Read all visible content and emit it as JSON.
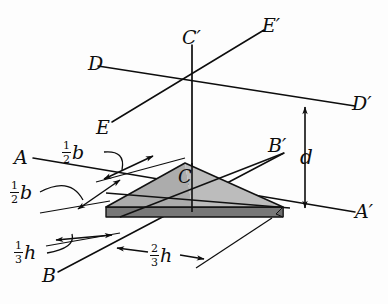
{
  "figure": {
    "kind": "engineering-diagram",
    "background_color": "#fdfdfd",
    "line_color": "#0d0d0d",
    "plate": {
      "top_face_color": "#b7b7b7",
      "left_face_color": "#a8a8a8",
      "edge_band_color": "#787878",
      "outline_color": "#111111"
    }
  },
  "labels": {
    "axis_A": "A",
    "axis_A_prime": "A′",
    "axis_B": "B",
    "axis_B_prime": "B′",
    "axis_D": "D",
    "axis_D_prime": "D′",
    "axis_E": "E",
    "axis_E_prime": "E′",
    "centroid": "C",
    "centroid_prime": "C′",
    "distance_d": "d"
  },
  "dimensions": [
    {
      "id": "half-b-upper",
      "numerator": "1",
      "denominator": "2",
      "symbol": "b"
    },
    {
      "id": "half-b-lower",
      "numerator": "1",
      "denominator": "2",
      "symbol": "b"
    },
    {
      "id": "third-h",
      "numerator": "1",
      "denominator": "3",
      "symbol": "h"
    },
    {
      "id": "two-thirds-h",
      "numerator": "2",
      "denominator": "3",
      "symbol": "h"
    }
  ]
}
